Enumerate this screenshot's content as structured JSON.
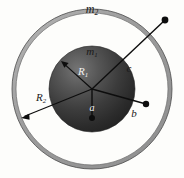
{
  "figure": {
    "background_color": "#fdfdfb",
    "geometry": {
      "center_x": 92,
      "center_y": 89,
      "shell_outer_radius": 80,
      "shell_inner_radius": 76,
      "sphere_radius": 43
    },
    "colors": {
      "shell_fill": "#a8a8a8",
      "shell_stroke": "#4d4d4d",
      "sphere_dark": "#2a2a2a",
      "sphere_light": "#6e6e6e",
      "line_color": "#111111",
      "label_light": "#1a1a1a",
      "label_dark": "#f2f2f2"
    },
    "labels": [
      {
        "id": "m2",
        "base": "m",
        "subscript": "2",
        "x": 92,
        "y": 10,
        "font_size": 12,
        "tone": "light",
        "description": "mass of outer spherical shell"
      },
      {
        "id": "m1",
        "base": "m",
        "subscript": "1",
        "x": 92,
        "y": 52,
        "font_size": 11,
        "tone": "light",
        "description": "mass of inner solid sphere"
      },
      {
        "id": "R1",
        "base": "R",
        "subscript": "1",
        "x": 83,
        "y": 72,
        "font_size": 11,
        "tone": "dark",
        "description": "radius of inner sphere"
      },
      {
        "id": "R2",
        "base": "R",
        "subscript": "2",
        "x": 41,
        "y": 98,
        "font_size": 11,
        "tone": "light",
        "description": "radius of outer shell"
      },
      {
        "id": "a",
        "base": "a",
        "subscript": "",
        "x": 92,
        "y": 108,
        "font_size": 10,
        "tone": "dark",
        "description": "radial distance a, inside inner sphere"
      },
      {
        "id": "b",
        "base": "b",
        "subscript": "",
        "x": 134,
        "y": 113,
        "font_size": 11,
        "tone": "light",
        "description": "radial distance b, between sphere and shell"
      },
      {
        "id": "c",
        "base": "c",
        "subscript": "",
        "x": 129,
        "y": 68,
        "font_size": 11,
        "tone": "light",
        "description": "radial distance c, outside the shell"
      }
    ],
    "radial_lines": [
      {
        "id": "line-a",
        "label": "a",
        "x1": 92,
        "y1": 89,
        "x2": 92,
        "y2": 118,
        "endpoint_dot": true,
        "dot_radius": 3.0
      },
      {
        "id": "line-b",
        "label": "b",
        "x1": 92,
        "y1": 89,
        "x2": 146,
        "y2": 104,
        "endpoint_dot": true,
        "dot_radius": 3.2
      },
      {
        "id": "line-c",
        "label": "c",
        "x1": 92,
        "y1": 89,
        "x2": 165,
        "y2": 20,
        "endpoint_dot": true,
        "dot_radius": 3.4
      }
    ],
    "radius_arrows": [
      {
        "id": "arrow-R1",
        "label": "R1",
        "x1": 92,
        "y1": 89,
        "x2": 62,
        "y2": 62,
        "arrowhead": true
      },
      {
        "id": "arrow-R2",
        "label": "R2",
        "x1": 92,
        "y1": 89,
        "x2": 22,
        "y2": 118,
        "arrowhead": true
      }
    ]
  }
}
